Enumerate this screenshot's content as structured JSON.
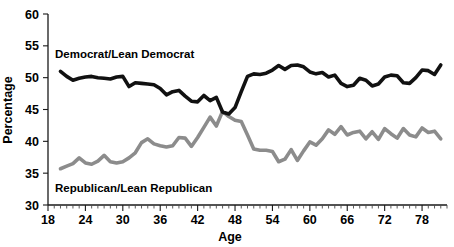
{
  "chart_data": {
    "type": "line",
    "title": "",
    "xlabel": "Age",
    "ylabel": "Percentage",
    "xlim": [
      18,
      82
    ],
    "ylim": [
      30,
      60
    ],
    "grid": false,
    "legend_position": "inline-annotation",
    "x_ticks_major": [
      18,
      24,
      30,
      36,
      42,
      48,
      54,
      60,
      66,
      72,
      78
    ],
    "x_ticks_minor_step": 1,
    "y_ticks_major": [
      30,
      35,
      40,
      45,
      50,
      55,
      60
    ],
    "x": [
      20,
      21,
      22,
      23,
      24,
      25,
      26,
      27,
      28,
      29,
      30,
      31,
      32,
      33,
      34,
      35,
      36,
      37,
      38,
      39,
      40,
      41,
      42,
      43,
      44,
      45,
      46,
      47,
      48,
      49,
      50,
      51,
      52,
      53,
      54,
      55,
      56,
      57,
      58,
      59,
      60,
      61,
      62,
      63,
      64,
      65,
      66,
      67,
      68,
      69,
      70,
      71,
      72,
      73,
      74,
      75,
      76,
      77,
      78,
      79,
      80,
      81
    ],
    "series": [
      {
        "name": "Democrat/Lean Democrat",
        "color": "#111111",
        "label": "Democrat/Lean Democrat",
        "values": [
          51.0,
          50.2,
          49.6,
          49.9,
          50.1,
          50.2,
          50.0,
          49.9,
          49.8,
          50.1,
          50.2,
          48.6,
          49.2,
          49.1,
          49.0,
          48.9,
          48.3,
          47.3,
          47.8,
          48.0,
          47.1,
          46.3,
          46.2,
          47.2,
          46.4,
          46.9,
          44.6,
          44.3,
          45.3,
          47.8,
          50.2,
          50.6,
          50.5,
          50.7,
          51.2,
          51.9,
          51.3,
          51.9,
          52.0,
          51.7,
          50.9,
          50.6,
          50.8,
          50.1,
          50.4,
          49.1,
          48.6,
          48.8,
          49.9,
          49.6,
          48.7,
          49.0,
          50.1,
          50.4,
          50.3,
          49.2,
          49.1,
          50.0,
          51.2,
          51.1,
          50.5,
          52.0
        ]
      },
      {
        "name": "Republican/Lean Republican",
        "color": "#8c8c8c",
        "label": "Republican/Lean Republican",
        "values": [
          35.7,
          36.1,
          36.5,
          37.4,
          36.6,
          36.4,
          36.9,
          37.8,
          36.8,
          36.6,
          36.8,
          37.4,
          38.2,
          39.8,
          40.4,
          39.6,
          39.3,
          39.1,
          39.3,
          40.6,
          40.5,
          39.2,
          40.6,
          42.2,
          43.8,
          42.4,
          44.7,
          43.9,
          43.3,
          43.1,
          41.0,
          38.8,
          38.6,
          38.6,
          38.4,
          36.8,
          37.2,
          38.7,
          37.0,
          38.5,
          39.9,
          39.4,
          40.4,
          41.8,
          41.1,
          42.3,
          41.0,
          41.4,
          41.6,
          40.4,
          41.5,
          40.3,
          42.0,
          41.2,
          40.5,
          42.0,
          41.0,
          40.7,
          42.1,
          41.4,
          41.6,
          40.4
        ]
      }
    ]
  },
  "axes": {
    "y_label": "Percentage",
    "x_label": "Age",
    "y_tick_labels": [
      "60",
      "55",
      "50",
      "45",
      "40",
      "35",
      "30"
    ],
    "x_tick_labels": [
      "18",
      "24",
      "30",
      "36",
      "42",
      "48",
      "54",
      "60",
      "66",
      "72",
      "78"
    ]
  },
  "annotations": {
    "democrat_label": "Democrat/Lean Democrat",
    "republican_label": "Republican/Lean Republican"
  },
  "colors": {
    "democrat": "#111111",
    "republican": "#8c8c8c",
    "axis": "#1a1a1a",
    "background": "#ffffff"
  }
}
